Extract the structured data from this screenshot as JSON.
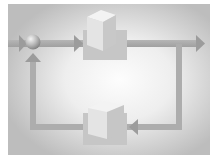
{
  "diagram": {
    "type": "feedback-control-loop",
    "labels": [],
    "colors": {
      "page_background": "#ffffff",
      "frame_edge": "#b8b8b8",
      "frame_center": "#fafafa",
      "arrow": "#a9a9a9",
      "block_shadow": "#c4c4c4",
      "cube_top": "#f2f2f2",
      "cube_left": "#e6e6e6",
      "cube_right": "#c9c9c9",
      "sphere_light": "#f0f0f0",
      "sphere_dark": "#8e8e8e"
    },
    "nodes": [
      {
        "id": "summing-junction",
        "shape": "sphere"
      },
      {
        "id": "forward-block",
        "shape": "cube",
        "position": "top"
      },
      {
        "id": "feedback-block",
        "shape": "cube",
        "position": "bottom"
      }
    ],
    "edges": [
      {
        "from": "input",
        "to": "summing-junction",
        "direction": "right"
      },
      {
        "from": "summing-junction",
        "to": "forward-block",
        "direction": "right"
      },
      {
        "from": "forward-block",
        "to": "output",
        "direction": "right"
      },
      {
        "from": "output",
        "to": "feedback-block",
        "direction": "left"
      },
      {
        "from": "feedback-block",
        "to": "summing-junction",
        "direction": "up"
      }
    ]
  }
}
